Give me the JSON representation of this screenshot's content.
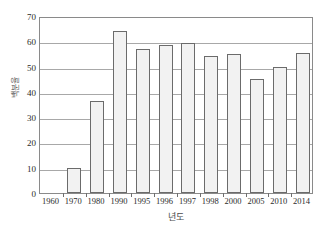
{
  "chart_data": {
    "type": "bar",
    "title": "",
    "subtitle": "",
    "xlabel": "년도",
    "ylabel": "백분율",
    "categories": [
      "1960",
      "1970",
      "1980",
      "1990",
      "1995",
      "1996",
      "1997",
      "1998",
      "2000",
      "2005",
      "2010",
      "2014"
    ],
    "values": [
      0,
      10,
      36.5,
      64,
      57,
      58.5,
      59.5,
      54,
      55,
      45,
      50,
      55.5
    ],
    "ylim": [
      0,
      70
    ],
    "y_ticks": [
      0,
      10,
      20,
      30,
      40,
      50,
      60,
      70
    ],
    "grid": true,
    "legend": "none",
    "series": [
      {
        "name": "백분율",
        "values": [
          0,
          10,
          36.5,
          64,
          57,
          58.5,
          59.5,
          54,
          55,
          45,
          50,
          55.5
        ]
      }
    ],
    "colors": {
      "bar_fill": "#f2f2f2",
      "bar_border": "#6b6b6b",
      "gridline": "#a8a8a8",
      "axis": "#8a8a8a",
      "tick_text": "#2b2b2b",
      "axis_title": "#4a4a4a"
    }
  },
  "footer": {
    "artifact_text": ""
  }
}
